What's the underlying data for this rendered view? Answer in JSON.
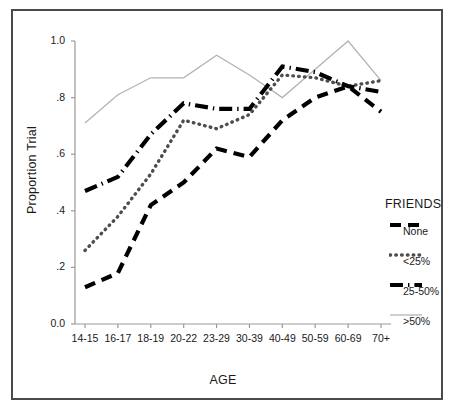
{
  "chart_data": {
    "type": "line",
    "title": "",
    "xlabel": "AGE",
    "ylabel": "Proportion Trial",
    "categories": [
      "14-15",
      "16-17",
      "18-19",
      "20-22",
      "23-29",
      "30-39",
      "40-49",
      "50-59",
      "60-69",
      "70+"
    ],
    "ylim": [
      0.0,
      1.0
    ],
    "ytick_labels": [
      "0.0",
      ".2",
      ".4",
      ".6",
      ".8",
      "1.0"
    ],
    "ytick_values": [
      0.0,
      0.2,
      0.4,
      0.6,
      0.8,
      1.0
    ],
    "grid": false,
    "legend_position": "right",
    "legend_title": "FRIENDS",
    "series": [
      {
        "name": "None",
        "style": "dashed",
        "color": "#000000",
        "values": [
          0.13,
          0.18,
          0.42,
          0.5,
          0.62,
          0.59,
          0.72,
          0.8,
          0.84,
          0.75
        ]
      },
      {
        "name": "<25%",
        "style": "dotted",
        "color": "#4d4d4d",
        "values": [
          0.26,
          0.38,
          0.53,
          0.72,
          0.69,
          0.74,
          0.88,
          0.87,
          0.84,
          0.86
        ]
      },
      {
        "name": "25-50%",
        "style": "dash-dot",
        "color": "#000000",
        "values": [
          0.47,
          0.52,
          0.67,
          0.78,
          0.76,
          0.76,
          0.91,
          0.89,
          0.84,
          0.82
        ]
      },
      {
        "name": ">50%",
        "style": "thin-solid",
        "color": "#b3b3b3",
        "values": [
          0.71,
          0.81,
          0.87,
          0.87,
          0.95,
          0.88,
          0.8,
          0.9,
          1.0,
          0.86
        ]
      }
    ]
  },
  "axes": {
    "y_title": "Proportion Trial",
    "x_title": "AGE"
  }
}
